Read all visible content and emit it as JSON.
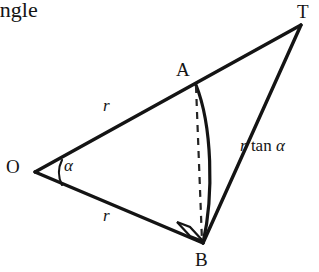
{
  "figure": {
    "caption_fragment": "angle",
    "background_color": "#ffffff",
    "stroke_color": "#141414",
    "vertices": {
      "O": {
        "label": "O",
        "x": 35,
        "y": 172
      },
      "A": {
        "label": "A",
        "x": 196,
        "y": 85
      },
      "B": {
        "label": "B",
        "x": 203,
        "y": 243
      },
      "T": {
        "label": "T",
        "x": 301,
        "y": 25
      }
    },
    "labels": {
      "radius_upper": "r",
      "radius_lower": "r",
      "angle": "α",
      "tangent_italic_r": "r",
      "tangent_upright_tan": "tan",
      "tangent_italic_alpha": "α",
      "tangent_full": "r tan α"
    },
    "segments": [
      {
        "name": "O-to-T",
        "from": "O",
        "to": "T",
        "style": "solid",
        "label": "r"
      },
      {
        "name": "O-to-B",
        "from": "O",
        "to": "B",
        "style": "solid",
        "label": "r"
      },
      {
        "name": "T-to-B",
        "from": "T",
        "to": "B",
        "style": "solid",
        "label": "r tan α"
      },
      {
        "name": "A-to-B-dashed",
        "from": "A",
        "to": "B",
        "style": "dashed",
        "label": ""
      }
    ],
    "arcs": [
      {
        "name": "angle-arc-at-O",
        "at": "O",
        "label": "α"
      },
      {
        "name": "circular-arc-A-to-B",
        "from": "A",
        "to": "B",
        "label": ""
      }
    ],
    "markers": [
      {
        "name": "right-angle-at-B",
        "at": "B",
        "type": "right-angle-square"
      }
    ]
  }
}
